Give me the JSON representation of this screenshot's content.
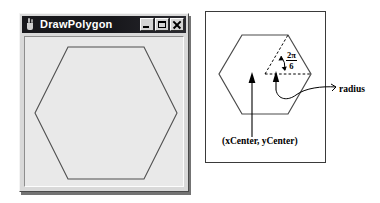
{
  "window": {
    "title": "DrawPolygon",
    "icon": "java-coffee-cup-icon",
    "buttons": [
      {
        "name": "minimize-button",
        "glyph": "minimize"
      },
      {
        "name": "maximize-button",
        "glyph": "maximize"
      },
      {
        "name": "close-button",
        "glyph": "close"
      }
    ],
    "canvas": {
      "shape": "hexagon",
      "sides": 6,
      "orientation": "flat-top"
    }
  },
  "diagram": {
    "shape": "hexagon",
    "sides": 6,
    "labels": {
      "center": "(xCenter, yCenter)",
      "radius": "radius",
      "angle_numerator": "2π",
      "angle_denominator": "6"
    },
    "annotations": [
      "dashed-radius-to-top-right-vertex",
      "dashed-radius-to-right-vertex",
      "angle-arc-between-radii",
      "center-arrow",
      "radius-arrow"
    ]
  },
  "colors": {
    "titlebar": "#18181c",
    "titlebar_text": "#ffffff",
    "window_face": "#d9d9d9",
    "client_area": "#e9e9e9",
    "outline": "#3a3a3a",
    "ink": "#000000"
  }
}
